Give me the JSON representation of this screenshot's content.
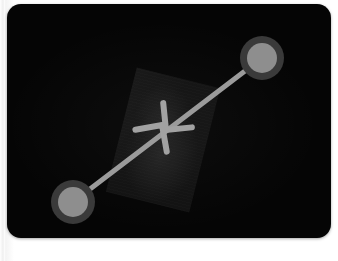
{
  "screen": {
    "name": "photo-viewer-screen",
    "background_color": "#050505",
    "panel_color": "#050505",
    "page_background_color": "#fbfbfb",
    "corner_radius_px": 14
  },
  "photo": {
    "label": "dim-photo-thumbnail",
    "fill_color": "#131313",
    "rotation_deg": 14
  },
  "gesture": {
    "type": "pinch-in",
    "name": "pinch-zoom-out-gesture",
    "stroke_color": "#9b9b9b",
    "line_width_px": 5,
    "touch_points": [
      {
        "id": "touch-point-top-right",
        "label": "Touch point 2",
        "cx": 262,
        "cy": 58,
        "outer_radius": 22,
        "inner_radius": 15,
        "outer_color": "#3a3a3a",
        "inner_color": "#8e8e8e"
      },
      {
        "id": "touch-point-bottom-left",
        "label": "Touch point 1",
        "cx": 73,
        "cy": 202,
        "outer_radius": 22,
        "inner_radius": 15,
        "outer_color": "#3a3a3a",
        "inner_color": "#8e8e8e"
      }
    ],
    "connector": {
      "id": "gesture-connector-line",
      "x1": 73,
      "y1": 202,
      "x2": 262,
      "y2": 58,
      "color": "#9b9b9b"
    },
    "arrowheads": [
      {
        "id": "arrowhead-inward-upper",
        "direction": "down-left",
        "tip_x": 166,
        "tip_y": 130,
        "color": "#a2a2a2"
      },
      {
        "id": "arrowhead-inward-lower",
        "direction": "up-right",
        "tip_x": 170,
        "tip_y": 118,
        "color": "#a2a2a2"
      }
    ]
  },
  "caption": {
    "line": "",
    "fragments": [
      "",
      "",
      "",
      "",
      ""
    ]
  }
}
